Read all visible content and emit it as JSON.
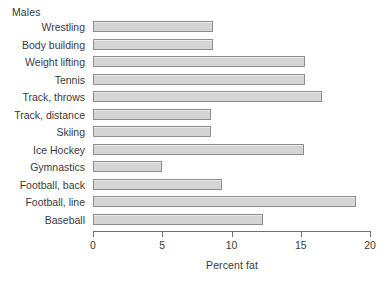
{
  "chart_data": {
    "type": "bar",
    "orientation": "horizontal",
    "title": "Males",
    "xlabel": "Percent fat",
    "ylabel": "",
    "xlim": [
      0,
      20
    ],
    "xticks": [
      0,
      5,
      10,
      15,
      20
    ],
    "xtick_labels": [
      "0",
      "5",
      "10",
      "15",
      "20"
    ],
    "grid": false,
    "legend": null,
    "bar_fill_color": "#d5d5d5",
    "bar_border_color": "#8d8d8d",
    "axis_color": "#6f6f6f",
    "text_color": "#3a3a3a",
    "categories": [
      "Wrestling",
      "Body building",
      "Weight lifting",
      "Tennis",
      "Track, throws",
      "Track, distance",
      "Skiing",
      "Ice Hockey",
      "Gymnastics",
      "Football, back",
      "Football, line",
      "Baseball"
    ],
    "values": [
      8.7,
      8.7,
      15.3,
      15.3,
      16.5,
      8.5,
      8.5,
      15.2,
      5.0,
      9.3,
      19.0,
      12.3
    ]
  }
}
